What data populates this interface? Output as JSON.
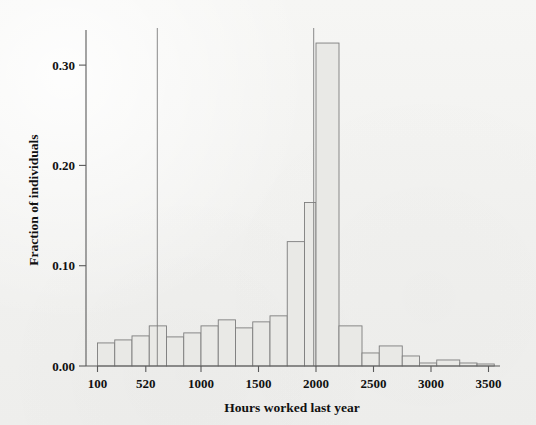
{
  "chart_data": {
    "type": "bar",
    "title": "",
    "xlabel": "Hours worked last year",
    "ylabel": "Fraction of individuals",
    "xlim": [
      0,
      3600
    ],
    "ylim": [
      0.0,
      0.335
    ],
    "grid": false,
    "legend": null,
    "x_tick_labels": [
      "100",
      "520",
      "1000",
      "1500",
      "2000",
      "2500",
      "3000",
      "3500"
    ],
    "x_tick_values": [
      100,
      520,
      1000,
      1500,
      2000,
      2500,
      3000,
      3500
    ],
    "y_tick_labels": [
      "0.00",
      "0.10",
      "0.20",
      "0.30"
    ],
    "y_tick_values": [
      0.0,
      0.1,
      0.2,
      0.3
    ],
    "bin_edges": [
      100,
      250,
      400,
      550,
      700,
      850,
      1000,
      1150,
      1300,
      1450,
      1600,
      1750,
      1900,
      2000,
      2200,
      2400,
      2550,
      2750,
      2900,
      3050,
      3250,
      3400,
      3550
    ],
    "categories": [
      "100-250",
      "250-400",
      "400-550",
      "550-700",
      "700-850",
      "850-1000",
      "1000-1150",
      "1150-1300",
      "1300-1450",
      "1450-1600",
      "1600-1750",
      "1750-1900",
      "1900-2000",
      "2000-2200",
      "2200-2400",
      "2400-2550",
      "2550-2750",
      "2750-2900",
      "2900-3050",
      "3050-3250",
      "3250-3400",
      "3400-3550"
    ],
    "values": [
      0.023,
      0.026,
      0.03,
      0.04,
      0.029,
      0.033,
      0.04,
      0.046,
      0.038,
      0.044,
      0.05,
      0.124,
      0.163,
      0.322,
      0.04,
      0.013,
      0.02,
      0.01,
      0.003,
      0.006,
      0.003,
      0.002
    ],
    "spikes": [
      {
        "x": 620,
        "value": 0.345,
        "note": "truncated spike at 620 hours exceeds plot top"
      },
      {
        "x": 1980,
        "value": 0.34,
        "note": "truncated spike just below 2000 hours exceeds plot top"
      }
    ],
    "colors": {
      "bar_fill": "#e9e9e6",
      "bar_stroke": "#7d7d7d",
      "axis": "#5a5a5a",
      "text": "#111111",
      "background": "#f3f3f1"
    }
  },
  "figure": {
    "x_axis_title": "Hours worked last year",
    "y_axis_title": "Fraction of individuals"
  }
}
